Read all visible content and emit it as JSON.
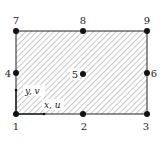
{
  "figure": {
    "colors": {
      "background": "#ffffff",
      "outline": "#222222",
      "hatch": "#9a9a9a",
      "node": "#111111",
      "label_bg": "#ffffff"
    },
    "rect": {
      "x": 16,
      "y": 31,
      "width": 131,
      "height": 83
    },
    "nodes": [
      {
        "id": "1",
        "label": "1",
        "x": 16,
        "y": 114,
        "lx": 16,
        "ly": 130,
        "anchor": "middle"
      },
      {
        "id": "2",
        "label": "2",
        "x": 83,
        "y": 114,
        "lx": 84,
        "ly": 130,
        "anchor": "middle"
      },
      {
        "id": "3",
        "label": "3",
        "x": 147,
        "y": 114,
        "lx": 146,
        "ly": 130,
        "anchor": "middle"
      },
      {
        "id": "4",
        "label": "4",
        "x": 16,
        "y": 73,
        "lx": 8,
        "ly": 77,
        "anchor": "middle"
      },
      {
        "id": "5",
        "label": "5",
        "x": 83,
        "y": 74,
        "lx": 75,
        "ly": 78,
        "anchor": "middle"
      },
      {
        "id": "6",
        "label": "6",
        "x": 147,
        "y": 73,
        "lx": 154,
        "ly": 77,
        "anchor": "middle"
      },
      {
        "id": "7",
        "label": "7",
        "x": 16,
        "y": 31,
        "lx": 16,
        "ly": 24,
        "anchor": "middle"
      },
      {
        "id": "8",
        "label": "8",
        "x": 83,
        "y": 31,
        "lx": 83,
        "ly": 24,
        "anchor": "middle"
      },
      {
        "id": "9",
        "label": "9",
        "x": 147,
        "y": 31,
        "lx": 147,
        "ly": 24,
        "anchor": "middle"
      }
    ],
    "axes": {
      "y_label": "y, v",
      "x_label": "x, u"
    }
  }
}
